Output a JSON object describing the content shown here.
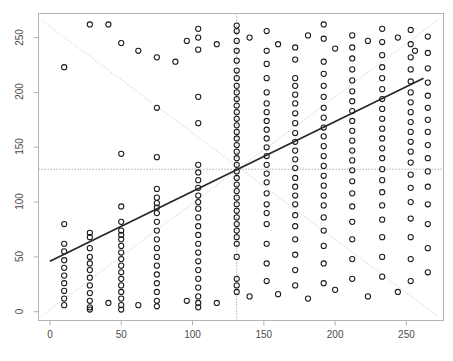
{
  "figure": {
    "top_text": "",
    "background": "#ffffff",
    "frame_color": "#b4b4b4",
    "point_color": "#1a1a1a",
    "fit_line_color": "#262626",
    "guide_line_color": "#cccccc",
    "crosshair_color": "#8c8c8c"
  },
  "chart_data": {
    "type": "scatter",
    "title": "",
    "xlabel": "",
    "ylabel": "",
    "xlim": [
      -8,
      276
    ],
    "ylim": [
      -8,
      272
    ],
    "xticks": [
      0,
      50,
      100,
      150,
      200,
      250
    ],
    "yticks": [
      0,
      50,
      100,
      150,
      200,
      250
    ],
    "xtick_labels": [
      "0",
      "50",
      "100",
      "150",
      "200",
      "250"
    ],
    "ytick_labels": [
      "0",
      "50",
      "100",
      "150",
      "200",
      "250"
    ],
    "grid": false,
    "legend": null,
    "marker": "open-circle",
    "marker_size": 4,
    "annotations": [
      {
        "name": "regression-line",
        "type": "line",
        "style": "solid",
        "color": "#262626",
        "x": [
          0,
          262
        ],
        "y": [
          46,
          213
        ]
      },
      {
        "name": "ascending-guide-line",
        "type": "line",
        "style": "dotted",
        "color": "#cccccc",
        "x": [
          -6,
          272
        ],
        "y": [
          -4,
          266
        ]
      },
      {
        "name": "descending-guide-line",
        "type": "line",
        "style": "dotted",
        "color": "#cccccc",
        "x": [
          -6,
          272
        ],
        "y": [
          266,
          -4
        ]
      },
      {
        "name": "centroid-vertical-line",
        "type": "vline",
        "style": "dotted",
        "color": "#8c8c8c",
        "x": 131
      },
      {
        "name": "centroid-horizontal-line",
        "type": "hline",
        "style": "dotted",
        "color": "#8c8c8c",
        "y": 130
      }
    ],
    "points": [
      [
        10,
        223
      ],
      [
        10,
        80
      ],
      [
        10,
        62
      ],
      [
        10,
        55
      ],
      [
        10,
        47
      ],
      [
        10,
        40
      ],
      [
        10,
        33
      ],
      [
        10,
        26
      ],
      [
        10,
        19
      ],
      [
        10,
        12
      ],
      [
        10,
        6
      ],
      [
        28,
        262
      ],
      [
        28,
        72
      ],
      [
        28,
        68
      ],
      [
        28,
        58
      ],
      [
        28,
        50
      ],
      [
        28,
        44
      ],
      [
        28,
        38
      ],
      [
        28,
        31
      ],
      [
        28,
        24
      ],
      [
        28,
        17
      ],
      [
        28,
        10
      ],
      [
        28,
        4
      ],
      [
        28,
        2
      ],
      [
        50,
        245
      ],
      [
        50,
        144
      ],
      [
        50,
        96
      ],
      [
        50,
        82
      ],
      [
        50,
        74
      ],
      [
        50,
        70
      ],
      [
        50,
        66
      ],
      [
        50,
        60
      ],
      [
        50,
        54
      ],
      [
        50,
        48
      ],
      [
        50,
        42
      ],
      [
        50,
        36
      ],
      [
        50,
        30
      ],
      [
        50,
        24
      ],
      [
        50,
        18
      ],
      [
        50,
        12
      ],
      [
        50,
        6
      ],
      [
        50,
        2
      ],
      [
        75,
        232
      ],
      [
        75,
        186
      ],
      [
        75,
        141
      ],
      [
        75,
        112
      ],
      [
        75,
        104
      ],
      [
        75,
        99
      ],
      [
        75,
        95
      ],
      [
        75,
        90
      ],
      [
        75,
        82
      ],
      [
        75,
        74
      ],
      [
        75,
        66
      ],
      [
        75,
        58
      ],
      [
        75,
        50
      ],
      [
        75,
        42
      ],
      [
        75,
        34
      ],
      [
        75,
        26
      ],
      [
        75,
        18
      ],
      [
        75,
        10
      ],
      [
        75,
        5
      ],
      [
        104,
        258
      ],
      [
        104,
        250
      ],
      [
        104,
        239
      ],
      [
        104,
        196
      ],
      [
        104,
        172
      ],
      [
        104,
        134
      ],
      [
        104,
        127
      ],
      [
        104,
        120
      ],
      [
        104,
        113
      ],
      [
        104,
        106
      ],
      [
        104,
        100
      ],
      [
        104,
        94
      ],
      [
        104,
        86
      ],
      [
        104,
        78
      ],
      [
        104,
        70
      ],
      [
        104,
        62
      ],
      [
        104,
        54
      ],
      [
        104,
        46
      ],
      [
        104,
        38
      ],
      [
        104,
        30
      ],
      [
        104,
        22
      ],
      [
        104,
        14
      ],
      [
        104,
        8
      ],
      [
        104,
        4
      ],
      [
        131,
        261
      ],
      [
        131,
        256
      ],
      [
        131,
        247
      ],
      [
        131,
        238
      ],
      [
        131,
        229
      ],
      [
        131,
        220
      ],
      [
        131,
        213
      ],
      [
        131,
        206
      ],
      [
        131,
        200
      ],
      [
        131,
        194
      ],
      [
        131,
        188
      ],
      [
        131,
        182
      ],
      [
        131,
        176
      ],
      [
        131,
        170
      ],
      [
        131,
        164
      ],
      [
        131,
        158
      ],
      [
        131,
        152
      ],
      [
        131,
        146
      ],
      [
        131,
        140
      ],
      [
        131,
        134
      ],
      [
        131,
        128
      ],
      [
        131,
        122
      ],
      [
        131,
        116
      ],
      [
        131,
        110
      ],
      [
        131,
        104
      ],
      [
        131,
        98
      ],
      [
        131,
        92
      ],
      [
        131,
        86
      ],
      [
        131,
        80
      ],
      [
        131,
        74
      ],
      [
        131,
        68
      ],
      [
        131,
        62
      ],
      [
        131,
        50
      ],
      [
        131,
        30
      ],
      [
        131,
        24
      ],
      [
        131,
        18
      ],
      [
        152,
        256
      ],
      [
        152,
        238
      ],
      [
        152,
        226
      ],
      [
        152,
        213
      ],
      [
        152,
        200
      ],
      [
        152,
        190
      ],
      [
        152,
        182
      ],
      [
        152,
        174
      ],
      [
        152,
        166
      ],
      [
        152,
        158
      ],
      [
        152,
        150
      ],
      [
        152,
        142
      ],
      [
        152,
        134
      ],
      [
        152,
        126
      ],
      [
        152,
        118
      ],
      [
        152,
        108
      ],
      [
        152,
        98
      ],
      [
        152,
        90
      ],
      [
        152,
        80
      ],
      [
        152,
        62
      ],
      [
        152,
        44
      ],
      [
        152,
        28
      ],
      [
        172,
        241
      ],
      [
        172,
        230
      ],
      [
        172,
        213
      ],
      [
        172,
        206
      ],
      [
        172,
        198
      ],
      [
        172,
        190
      ],
      [
        172,
        181
      ],
      [
        172,
        172
      ],
      [
        172,
        163
      ],
      [
        172,
        155
      ],
      [
        172,
        147
      ],
      [
        172,
        139
      ],
      [
        172,
        131
      ],
      [
        172,
        122
      ],
      [
        172,
        114
      ],
      [
        172,
        106
      ],
      [
        172,
        98
      ],
      [
        172,
        88
      ],
      [
        172,
        78
      ],
      [
        172,
        66
      ],
      [
        172,
        52
      ],
      [
        172,
        38
      ],
      [
        172,
        24
      ],
      [
        192,
        262
      ],
      [
        192,
        249
      ],
      [
        192,
        228
      ],
      [
        192,
        217
      ],
      [
        192,
        206
      ],
      [
        192,
        196
      ],
      [
        192,
        186
      ],
      [
        192,
        177
      ],
      [
        192,
        168
      ],
      [
        192,
        160
      ],
      [
        192,
        151
      ],
      [
        192,
        142
      ],
      [
        192,
        133
      ],
      [
        192,
        124
      ],
      [
        192,
        115
      ],
      [
        192,
        106
      ],
      [
        192,
        97
      ],
      [
        192,
        86
      ],
      [
        192,
        74
      ],
      [
        192,
        60
      ],
      [
        192,
        44
      ],
      [
        192,
        26
      ],
      [
        212,
        252
      ],
      [
        212,
        241
      ],
      [
        212,
        231
      ],
      [
        212,
        221
      ],
      [
        212,
        211
      ],
      [
        212,
        201
      ],
      [
        212,
        192
      ],
      [
        212,
        183
      ],
      [
        212,
        174
      ],
      [
        212,
        165
      ],
      [
        212,
        156
      ],
      [
        212,
        147
      ],
      [
        212,
        138
      ],
      [
        212,
        129
      ],
      [
        212,
        119
      ],
      [
        212,
        108
      ],
      [
        212,
        96
      ],
      [
        212,
        82
      ],
      [
        212,
        66
      ],
      [
        212,
        48
      ],
      [
        212,
        30
      ],
      [
        233,
        258
      ],
      [
        233,
        246
      ],
      [
        233,
        234
      ],
      [
        233,
        223
      ],
      [
        233,
        213
      ],
      [
        233,
        203
      ],
      [
        233,
        194
      ],
      [
        233,
        185
      ],
      [
        233,
        176
      ],
      [
        233,
        167
      ],
      [
        233,
        158
      ],
      [
        233,
        149
      ],
      [
        233,
        140
      ],
      [
        233,
        130
      ],
      [
        233,
        120
      ],
      [
        233,
        109
      ],
      [
        233,
        97
      ],
      [
        233,
        84
      ],
      [
        233,
        68
      ],
      [
        233,
        50
      ],
      [
        233,
        32
      ],
      [
        253,
        257
      ],
      [
        253,
        244
      ],
      [
        253,
        232
      ],
      [
        253,
        221
      ],
      [
        253,
        210
      ],
      [
        253,
        200
      ],
      [
        253,
        191
      ],
      [
        253,
        182
      ],
      [
        253,
        173
      ],
      [
        253,
        164
      ],
      [
        253,
        155
      ],
      [
        253,
        146
      ],
      [
        253,
        136
      ],
      [
        253,
        125
      ],
      [
        253,
        113
      ],
      [
        253,
        100
      ],
      [
        253,
        85
      ],
      [
        253,
        68
      ],
      [
        253,
        48
      ],
      [
        253,
        28
      ],
      [
        265,
        251
      ],
      [
        265,
        236
      ],
      [
        265,
        222
      ],
      [
        265,
        209
      ],
      [
        265,
        197
      ],
      [
        265,
        186
      ],
      [
        265,
        175
      ],
      [
        265,
        164
      ],
      [
        265,
        152
      ],
      [
        265,
        140
      ],
      [
        265,
        128
      ],
      [
        265,
        114
      ],
      [
        265,
        98
      ],
      [
        265,
        80
      ],
      [
        265,
        58
      ],
      [
        265,
        36
      ],
      [
        41,
        262
      ],
      [
        62,
        238
      ],
      [
        88,
        228
      ],
      [
        96,
        247
      ],
      [
        117,
        244
      ],
      [
        140,
        250
      ],
      [
        160,
        244
      ],
      [
        181,
        252
      ],
      [
        200,
        240
      ],
      [
        223,
        247
      ],
      [
        244,
        250
      ],
      [
        256,
        238
      ],
      [
        140,
        14
      ],
      [
        160,
        16
      ],
      [
        181,
        12
      ],
      [
        200,
        20
      ],
      [
        223,
        14
      ],
      [
        244,
        18
      ],
      [
        117,
        8
      ],
      [
        96,
        10
      ],
      [
        62,
        6
      ],
      [
        41,
        8
      ]
    ]
  }
}
